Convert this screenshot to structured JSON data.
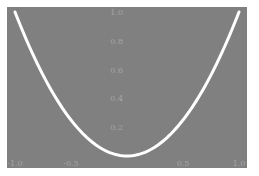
{
  "chart_data": {
    "type": "line",
    "title": "",
    "xlabel": "",
    "ylabel": "",
    "xlim": [
      -1.0,
      1.0
    ],
    "ylim": [
      0,
      1.0
    ],
    "grid": false,
    "legend": null,
    "x_tick_labels": [
      "-1.0",
      "-0.5",
      "0.5",
      "1.0"
    ],
    "y_tick_labels": [
      "0.2",
      "0.4",
      "0.6",
      "0.8",
      "1.0"
    ],
    "series": [
      {
        "name": "y = x^2",
        "x": [
          -1.0,
          -0.75,
          -0.5,
          -0.25,
          0.0,
          0.25,
          0.5,
          0.75,
          1.0
        ],
        "y": [
          1.0,
          0.5625,
          0.25,
          0.0625,
          0.0,
          0.0625,
          0.25,
          0.5625,
          1.0
        ],
        "color": "#ffffff"
      }
    ],
    "background_color": "#808080",
    "axis_label_color": "#a5a5a5"
  }
}
